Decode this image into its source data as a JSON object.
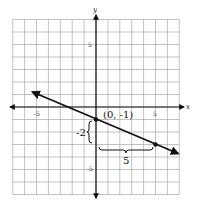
{
  "chart_data": {
    "type": "line",
    "title": "",
    "xlabel": "x",
    "ylabel": "y",
    "xlim": [
      -7,
      7
    ],
    "ylim": [
      -7,
      7
    ],
    "grid": true,
    "x_ticks_labeled": [
      "-5",
      "5"
    ],
    "y_ticks_labeled": [
      "5",
      "-5"
    ],
    "series": [
      {
        "name": "line",
        "equation": "y = -2/5 x - 1",
        "x": [
          -5.5,
          0,
          5,
          7
        ],
        "y": [
          1.2,
          -1,
          -3,
          -3.8
        ],
        "arrows_both_ends": true
      }
    ],
    "points": [
      {
        "x": 0,
        "y": -1,
        "label": "(0, -1)"
      },
      {
        "x": 5,
        "y": -3,
        "label": ""
      }
    ],
    "annotations": [
      {
        "type": "rise-brace",
        "text": "-2",
        "from": [
          0,
          -1
        ],
        "to": [
          0,
          -3
        ]
      },
      {
        "type": "run-brace",
        "text": "5",
        "from": [
          0,
          -3
        ],
        "to": [
          5,
          -3
        ]
      }
    ]
  },
  "labels": {
    "x_axis": "x",
    "y_axis": "y",
    "tick_x_neg5": "-5",
    "tick_x_5": "5",
    "tick_y_5": "5",
    "tick_y_neg5": "-5",
    "point_label": "(0, -1)",
    "rise": "-2",
    "run": "5"
  }
}
